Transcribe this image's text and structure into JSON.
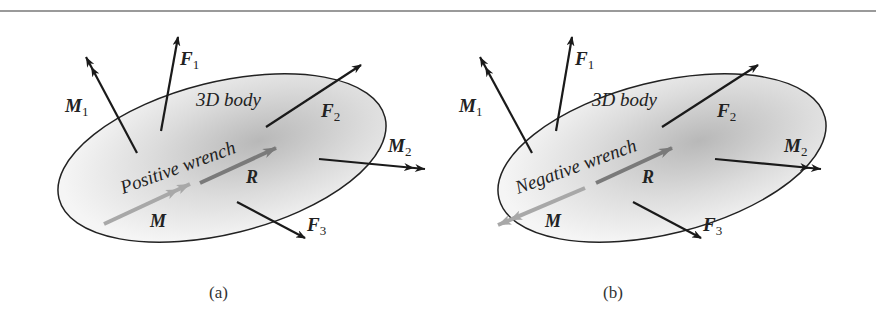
{
  "figure": {
    "panels": [
      {
        "id": "a",
        "caption": "(a)",
        "body_label": "3D body",
        "wrench_label": "Positive wrench",
        "forces": [
          "F",
          "F",
          "F"
        ],
        "force_subscripts": [
          "1",
          "2",
          "3"
        ],
        "moments": [
          "M",
          "M"
        ],
        "moment_subscripts": [
          "1",
          "2"
        ],
        "resultant_force": "R",
        "resultant_moment": "M",
        "moment_direction": "parallel to R"
      },
      {
        "id": "b",
        "caption": "(b)",
        "body_label": "3D body",
        "wrench_label": "Negative wrench",
        "forces": [
          "F",
          "F",
          "F"
        ],
        "force_subscripts": [
          "1",
          "2",
          "3"
        ],
        "moments": [
          "M",
          "M"
        ],
        "moment_subscripts": [
          "1",
          "2"
        ],
        "resultant_force": "R",
        "resultant_moment": "M",
        "moment_direction": "antiparallel to R"
      }
    ],
    "colors": {
      "outline": "#222222",
      "body_fill_light": "#f4f4f4",
      "body_fill_dark": "#bdbdbd",
      "resultant_arrow": "#7a7a7a",
      "moment_arrow": "#a8a8a8",
      "rule": "#9a9a9a"
    }
  }
}
